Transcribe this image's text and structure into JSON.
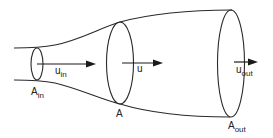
{
  "diagram": {
    "sections": [
      {
        "id": "inlet",
        "area_label": "A",
        "area_sub": "in",
        "velocity_label": "u",
        "velocity_sub": "in"
      },
      {
        "id": "middle",
        "area_label": "A",
        "area_sub": "",
        "velocity_label": "u",
        "velocity_sub": ""
      },
      {
        "id": "outlet",
        "area_label": "A",
        "area_sub": "out",
        "velocity_label": "u",
        "velocity_sub": "out"
      }
    ],
    "colors": {
      "stroke": "#2a2a2a",
      "arrow": "#1a1a1a",
      "text": "#222222",
      "background": "#ffffff"
    }
  }
}
